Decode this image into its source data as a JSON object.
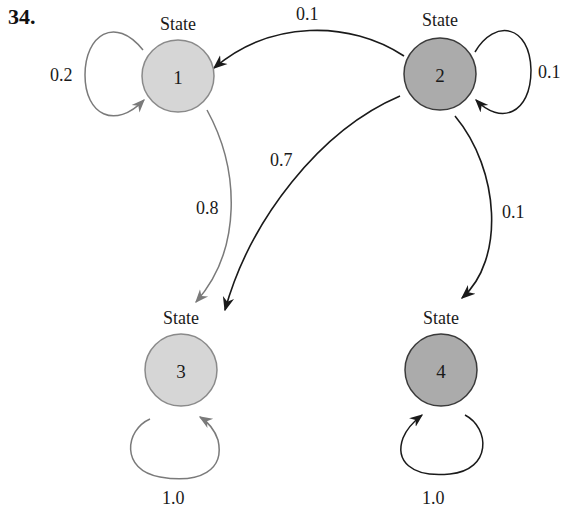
{
  "problem_number": "34.",
  "colors": {
    "light_fill": "#d6d6d6",
    "light_stroke": "#8a8a8a",
    "dark_fill": "#ababab",
    "dark_stroke": "#3a3a3a",
    "light_edge": "#7a7a7a",
    "dark_edge": "#1a1a1a"
  },
  "states": [
    {
      "id": "1",
      "label": "State",
      "number": "1",
      "shade": "light"
    },
    {
      "id": "2",
      "label": "State",
      "number": "2",
      "shade": "dark"
    },
    {
      "id": "3",
      "label": "State",
      "number": "3",
      "shade": "light"
    },
    {
      "id": "4",
      "label": "State",
      "number": "4",
      "shade": "dark"
    }
  ],
  "transitions": [
    {
      "from": "1",
      "to": "1",
      "probability": "0.2"
    },
    {
      "from": "1",
      "to": "3",
      "probability": "0.8"
    },
    {
      "from": "2",
      "to": "1",
      "probability": "0.1"
    },
    {
      "from": "2",
      "to": "2",
      "probability": "0.1"
    },
    {
      "from": "2",
      "to": "3",
      "probability": "0.7"
    },
    {
      "from": "2",
      "to": "4",
      "probability": "0.1"
    },
    {
      "from": "3",
      "to": "3",
      "probability": "1.0"
    },
    {
      "from": "4",
      "to": "4",
      "probability": "1.0"
    }
  ]
}
